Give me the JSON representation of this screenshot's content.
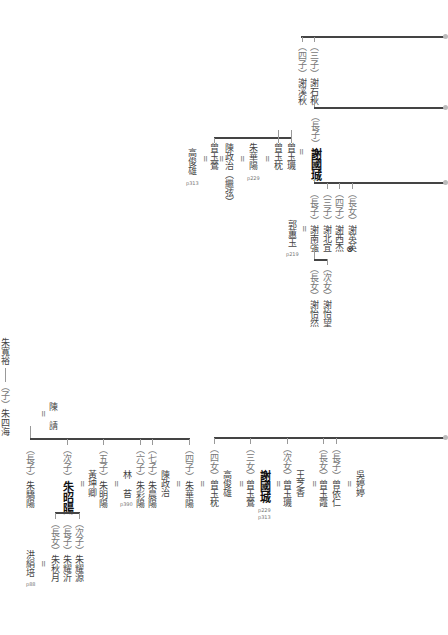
{
  "top_section": {
    "sons_row": [
      {
        "rel": "（四子）",
        "name": "謝溪秋"
      },
      {
        "rel": "（三子）",
        "name": "謝石秋"
      }
    ],
    "guocheng": {
      "rel": "（長子）",
      "name": "謝國城"
    },
    "guocheng_spouses": [
      {
        "name": "曾玉璣"
      },
      {
        "name": "曾玉枕"
      }
    ],
    "zhu_huayang": {
      "name": "朱華陽",
      "page": "p229"
    },
    "chen_zhengzhi": {
      "name": "陳政治（繼弦）"
    },
    "zeng_yuying": {
      "name": "曾玉鶯"
    },
    "gao_junxiong": {
      "name": "高俊雄",
      "page": "p313"
    },
    "children": [
      {
        "rel": "（長子）",
        "name": "謝南強"
      },
      {
        "rel": "（三子）",
        "name": "謝北宜"
      },
      {
        "rel": "（四子）",
        "name": "謝西杰"
      },
      {
        "rel": "（長女）",
        "name": "謝英英",
        "mark": "⊗"
      }
    ],
    "nanqiang_spouse": {
      "name": "郭蕙玉",
      "page": "p219"
    },
    "grandchildren": [
      {
        "rel": "（長女）",
        "name": "謝怡然"
      },
      {
        "rel": "（次女）",
        "name": "謝怡望"
      }
    ]
  },
  "bottom_section": {
    "ancestor": {
      "name": "朱寬裕"
    },
    "son": {
      "rel": "（子）",
      "name": "朱四海"
    },
    "son_spouse": {
      "name": "陳 請"
    },
    "zhu_children": [
      {
        "rel": "（長子）",
        "name": "朱驕陽"
      },
      {
        "rel": "（次子）",
        "name": "朱昭陽"
      },
      {
        "rel": "（五子）",
        "name": "朱明陽"
      },
      {
        "rel": "（六子）",
        "name": "朱彩陽"
      },
      {
        "rel": "（七子）",
        "name": "朱晨陽"
      },
      {
        "rel": "（四子）",
        "name": "朱華陽"
      }
    ],
    "zhaoyang_spouse": {
      "name": "黃坤卿"
    },
    "mingyang_spouse": {
      "name": "林 苔",
      "page": "p390"
    },
    "huayang_spouse": {
      "name": "陳政治"
    },
    "zhaoyang_children": [
      {
        "rel": "（長女）",
        "name": "朱秋月"
      },
      {
        "rel": "（長子）",
        "name": "朱耀沂"
      },
      {
        "rel": "（次子）",
        "name": "朱耀源"
      }
    ],
    "qiuyue_spouse": {
      "name": "洪絹培",
      "page": "p88"
    },
    "zeng_children": [
      {
        "rel": "（四女）",
        "name": "曾玉枕"
      },
      {
        "rel": "（三女）",
        "name": "曾玉鶯"
      },
      {
        "rel": "（次女）",
        "name": "曾玉璣"
      },
      {
        "rel": "（長女）",
        "name": "曾玉霞"
      },
      {
        "rel": "（長子）",
        "name": "曾依仁"
      }
    ],
    "yuzhen_spouse": {
      "name": "高俊雄"
    },
    "yuying_spouse": {
      "name": "謝國城",
      "page1": "p229",
      "page2": "p313"
    },
    "yuji_spouse": {
      "name": "王芝香"
    },
    "yiren_spouse": {
      "name": "吳婷婷"
    }
  },
  "symbols": {
    "equals": "="
  }
}
